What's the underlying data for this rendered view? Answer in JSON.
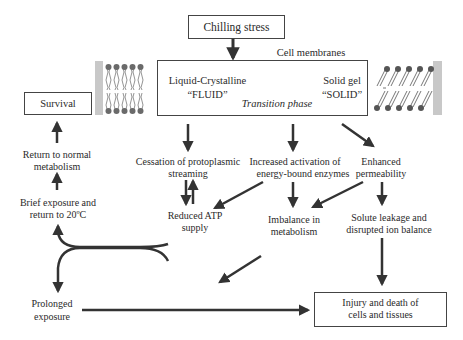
{
  "diagram": {
    "title_box": "Chilling stress",
    "membrane_label": "Cell membranes",
    "membrane_box": {
      "left_state": "Liquid-Crystalline",
      "left_state_quote": "“FLUID”",
      "transition": "Transition phase",
      "right_state": "Solid gel",
      "right_state_quote": "“SOLID”"
    },
    "nodes": {
      "survival": "Survival",
      "return_normal_1": "Return to normal",
      "return_normal_2": "metabolism",
      "brief_1": "Brief exposure and",
      "brief_2": "return to 20ºC",
      "cessation_1": "Cessation of protoplasmic",
      "cessation_2": "streaming",
      "increased_1": "Increased activation of",
      "increased_2": "energy-bound enzymes",
      "enhanced_1": "Enhanced",
      "enhanced_2": "permeability",
      "reduced_1": "Reduced ATP",
      "reduced_2": "supply",
      "imbalance_1": "Imbalance in",
      "imbalance_2": "metabolism",
      "solute_1": "Solute leakage and",
      "solute_2": "disrupted ion balance",
      "prolonged_1": "Prolonged",
      "prolonged_2": "exposure",
      "injury_1": "Injury and death of",
      "injury_2": "cells and tissues"
    },
    "icons": {
      "fluid_membrane": "lipid-bilayer-fluid-icon",
      "solid_membrane": "lipid-bilayer-solid-icon"
    },
    "colors": {
      "line": "#333333",
      "membrane_bar": "#c8c8c8",
      "lipid_head": "#6a6a6a"
    }
  }
}
